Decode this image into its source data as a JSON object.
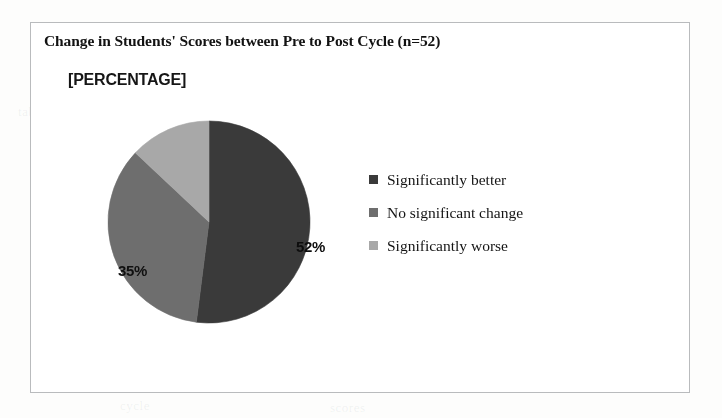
{
  "document": {
    "background_color": "#fdfdfc",
    "ghost_bleed_text": [
      "proof",
      "region",
      "student",
      "cycle",
      "scores",
      "table"
    ]
  },
  "chart_frame": {
    "border_color": "#b9bbbd",
    "background_color": "#ffffff"
  },
  "chart_data": {
    "type": "pie",
    "title": "Change in Students' Scores between Pre to Post Cycle (n=52)",
    "xlabel": "",
    "ylabel": "",
    "sample_size": 52,
    "categories": [
      "Significantly better",
      "No significant change",
      "Significantly worse"
    ],
    "values": [
      52,
      35,
      13
    ],
    "data_labels": [
      "52%",
      "35%",
      "[PERCENTAGE]"
    ],
    "colors": [
      "#3a3a3a",
      "#6e6e6e",
      "#a8a8a8"
    ],
    "start_angle_deg": 0,
    "direction": "clockwise",
    "legend_position": "right",
    "grid": false,
    "annotations": [
      {
        "text": "[PERCENTAGE]",
        "note": "broken data label placeholder rendered outside the pie, top-left"
      }
    ]
  },
  "labels": {
    "placeholder": "[PERCENTAGE]",
    "slice_better": "52%",
    "slice_nochange": "35%"
  },
  "legend": {
    "items": [
      {
        "label": "Significantly better",
        "color": "#3a3a3a"
      },
      {
        "label": "No significant change",
        "color": "#6e6e6e"
      },
      {
        "label": "Significantly worse",
        "color": "#a8a8a8"
      }
    ]
  }
}
